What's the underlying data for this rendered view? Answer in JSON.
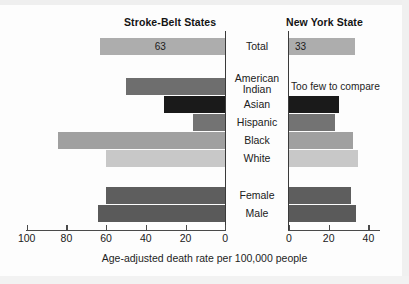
{
  "caption": "Age-adjusted death rate per 100,000 people",
  "panels": {
    "left": {
      "title": "Stroke-Belt States"
    },
    "right": {
      "title": "New York State"
    }
  },
  "notes": {
    "too_few": "Too few to compare"
  },
  "chart_data": {
    "type": "bar",
    "orientation": "horizontal",
    "layout": "back-to-back",
    "title": "",
    "xlabel": "Age-adjusted death rate per 100,000 people",
    "ylabel": "",
    "grid": false,
    "legend": "none",
    "categories": [
      "Total",
      "American Indian",
      "Asian",
      "Hispanic",
      "Black",
      "White",
      "Female",
      "Male"
    ],
    "category_display": [
      {
        "line1": "Total",
        "line2": ""
      },
      {
        "line1": "American",
        "line2": "Indian"
      },
      {
        "line1": "Asian",
        "line2": ""
      },
      {
        "line1": "Hispanic",
        "line2": ""
      },
      {
        "line1": "Black",
        "line2": ""
      },
      {
        "line1": "White",
        "line2": ""
      },
      {
        "line1": "Female",
        "line2": ""
      },
      {
        "line1": "Male",
        "line2": ""
      }
    ],
    "series": [
      {
        "name": "Stroke-Belt States",
        "axis": "left",
        "direction": "right-to-left",
        "xlim": [
          0,
          100
        ],
        "ticks": [
          100,
          80,
          60,
          40,
          20,
          0
        ],
        "tick_labels": [
          "100",
          "80",
          "60",
          "40",
          "20",
          "0"
        ],
        "values": [
          63,
          50,
          31,
          16,
          84,
          60,
          60,
          64
        ],
        "data_labels": [
          "63",
          "",
          "",
          "",
          "",
          "",
          "",
          ""
        ],
        "colors": [
          "#adadad",
          "#6e6e6e",
          "#1a1a1a",
          "#737373",
          "#a0a0a0",
          "#c8c8c8",
          "#5e5e5e",
          "#5a5a5a"
        ]
      },
      {
        "name": "New York State",
        "axis": "right",
        "direction": "left-to-right",
        "xlim": [
          0,
          46
        ],
        "ticks": [
          0,
          20,
          40
        ],
        "tick_labels": [
          "0",
          "20",
          "40"
        ],
        "values": [
          33,
          null,
          25,
          23,
          32,
          35,
          31,
          34
        ],
        "data_labels": [
          "33",
          "Too few to compare",
          "",
          "",
          "",
          "",
          "",
          ""
        ],
        "colors": [
          "#adadad",
          "#ffffff",
          "#1a1a1a",
          "#737373",
          "#a0a0a0",
          "#c8c8c8",
          "#5e5e5e",
          "#5a5a5a"
        ]
      }
    ]
  }
}
